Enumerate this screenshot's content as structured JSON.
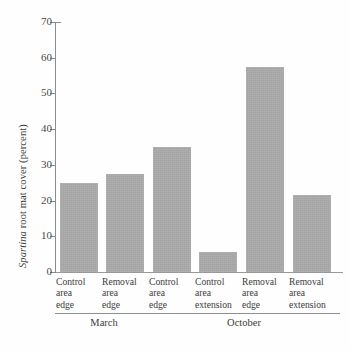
{
  "chart_data": {
    "type": "bar",
    "title": "",
    "xlabel": "",
    "ylabel": "Spartina root mat cover (percent)",
    "ylabel_italic_part": "Spartina",
    "ylabel_rest": " root mat cover (percent)",
    "ylim": [
      0,
      70
    ],
    "ytick_step": 10,
    "yticks": [
      0,
      10,
      20,
      30,
      40,
      50,
      60,
      70
    ],
    "ytick_labels": [
      "0",
      "10",
      "20",
      "30",
      "40",
      "50",
      "60",
      "70"
    ],
    "grid": false,
    "legend": "none",
    "bar_color": "#a9a9a9",
    "axis_color": "#8c8c8c",
    "categories": [
      "Control area edge",
      "Removal area edge",
      "Control area edge",
      "Control area extension",
      "Removal area edge",
      "Removal area extension"
    ],
    "category_lines": [
      [
        "Control",
        "area",
        "edge"
      ],
      [
        "Removal",
        "area",
        "edge"
      ],
      [
        "Control",
        "area",
        "edge"
      ],
      [
        "Control",
        "area",
        "extension"
      ],
      [
        "Removal",
        "area",
        "edge"
      ],
      [
        "Removal",
        "area",
        "extension"
      ]
    ],
    "values": [
      25,
      27.5,
      35,
      5.5,
      57.5,
      21.5
    ],
    "groups": [
      {
        "label": "March",
        "categories": [
          0,
          1
        ]
      },
      {
        "label": "October",
        "categories": [
          2,
          3,
          4,
          5
        ]
      }
    ]
  }
}
